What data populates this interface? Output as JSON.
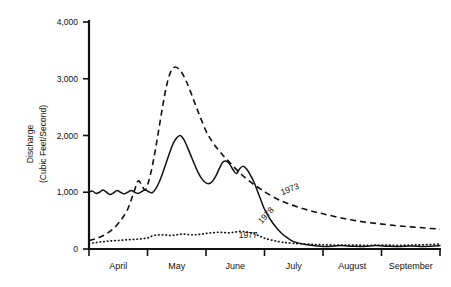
{
  "chart_data": {
    "type": "line",
    "title": "",
    "xlabel": "",
    "ylabel": "Discharge (Cubic Feet/Second)",
    "ylabel_line1": "Discharge",
    "ylabel_line2": "(Cubic Feet/Second)",
    "ylim": [
      0,
      4000
    ],
    "ytick_values": [
      0,
      1000,
      2000,
      3000,
      4000
    ],
    "ytick_labels": [
      "0",
      "1,000",
      "2,000",
      "3,000",
      "4,000"
    ],
    "categories": [
      "April",
      "May",
      "June",
      "July",
      "August",
      "September"
    ],
    "xlim": [
      0,
      6
    ],
    "xtick_values": [
      0,
      1,
      2,
      3,
      4,
      5,
      6
    ],
    "grid": false,
    "legend_position": "inline-annotations",
    "annotations": [
      {
        "text": "1973",
        "x": 3.45,
        "y": 1010,
        "rotation": -22
      },
      {
        "text": "1978",
        "x": 3.06,
        "y": 560,
        "rotation": -48
      },
      {
        "text": "1977",
        "x": 2.72,
        "y": 190,
        "rotation": 0
      }
    ],
    "series": [
      {
        "name": "1973",
        "style": "dashed",
        "x": [
          0.0,
          0.1,
          0.2,
          0.3,
          0.4,
          0.5,
          0.58,
          0.66,
          0.72,
          0.78,
          0.84,
          0.9,
          0.96,
          1.02,
          1.08,
          1.14,
          1.2,
          1.26,
          1.32,
          1.38,
          1.44,
          1.5,
          1.58,
          1.66,
          1.74,
          1.82,
          1.9,
          2.0,
          2.1,
          2.2,
          2.3,
          2.4,
          2.5,
          2.6,
          2.7,
          2.8,
          2.9,
          3.0,
          3.2,
          3.4,
          3.6,
          3.8,
          4.0,
          4.25,
          4.5,
          4.75,
          5.0,
          5.25,
          5.5,
          5.75,
          6.0
        ],
        "values": [
          150,
          175,
          215,
          270,
          345,
          450,
          560,
          700,
          860,
          1040,
          1200,
          1130,
          1040,
          1190,
          1450,
          1780,
          2150,
          2520,
          2850,
          3080,
          3190,
          3200,
          3120,
          2960,
          2760,
          2540,
          2330,
          2080,
          1900,
          1760,
          1640,
          1530,
          1420,
          1320,
          1230,
          1150,
          1080,
          1010,
          890,
          800,
          730,
          670,
          620,
          560,
          510,
          470,
          440,
          410,
          390,
          370,
          350
        ]
      },
      {
        "name": "1978",
        "style": "solid",
        "x": [
          0.0,
          0.06,
          0.12,
          0.18,
          0.24,
          0.3,
          0.36,
          0.42,
          0.48,
          0.54,
          0.6,
          0.66,
          0.72,
          0.78,
          0.84,
          0.9,
          0.96,
          1.02,
          1.08,
          1.14,
          1.2,
          1.26,
          1.32,
          1.38,
          1.44,
          1.5,
          1.56,
          1.62,
          1.68,
          1.74,
          1.8,
          1.86,
          1.92,
          1.98,
          2.04,
          2.1,
          2.16,
          2.22,
          2.28,
          2.34,
          2.4,
          2.46,
          2.52,
          2.58,
          2.64,
          2.7,
          2.76,
          2.82,
          2.88,
          2.94,
          3.0,
          3.1,
          3.2,
          3.3,
          3.4,
          3.5,
          3.7,
          3.9,
          4.1,
          4.3,
          4.5,
          4.7,
          4.9,
          5.1,
          5.3,
          5.5,
          5.7,
          5.85,
          6.0
        ],
        "values": [
          1000,
          1020,
          980,
          1000,
          1040,
          1000,
          960,
          990,
          1030,
          1000,
          970,
          1000,
          1030,
          1000,
          980,
          1010,
          1040,
          1010,
          990,
          1060,
          1180,
          1340,
          1520,
          1700,
          1860,
          1960,
          2000,
          1930,
          1800,
          1650,
          1500,
          1360,
          1250,
          1180,
          1150,
          1180,
          1270,
          1400,
          1520,
          1550,
          1500,
          1400,
          1330,
          1420,
          1460,
          1400,
          1300,
          1180,
          1020,
          860,
          700,
          520,
          380,
          270,
          190,
          130,
          80,
          55,
          45,
          60,
          50,
          45,
          60,
          50,
          45,
          55,
          45,
          50,
          60
        ]
      },
      {
        "name": "1977",
        "style": "dotted",
        "x": [
          0.0,
          0.1,
          0.2,
          0.3,
          0.4,
          0.5,
          0.6,
          0.7,
          0.8,
          0.9,
          1.0,
          1.1,
          1.2,
          1.3,
          1.4,
          1.5,
          1.6,
          1.7,
          1.8,
          1.9,
          2.0,
          2.1,
          2.2,
          2.3,
          2.4,
          2.5,
          2.6,
          2.7,
          2.8,
          2.9,
          3.0,
          3.15,
          3.3,
          3.5,
          3.75,
          4.0,
          4.25,
          4.5,
          4.75,
          5.0,
          5.25,
          5.5,
          5.75,
          6.0
        ],
        "values": [
          100,
          110,
          125,
          135,
          145,
          150,
          160,
          165,
          170,
          180,
          195,
          235,
          250,
          245,
          240,
          250,
          265,
          255,
          250,
          260,
          275,
          285,
          295,
          290,
          285,
          300,
          310,
          300,
          275,
          235,
          190,
          150,
          120,
          100,
          85,
          75,
          70,
          70,
          65,
          70,
          65,
          70,
          75,
          90
        ]
      }
    ]
  }
}
